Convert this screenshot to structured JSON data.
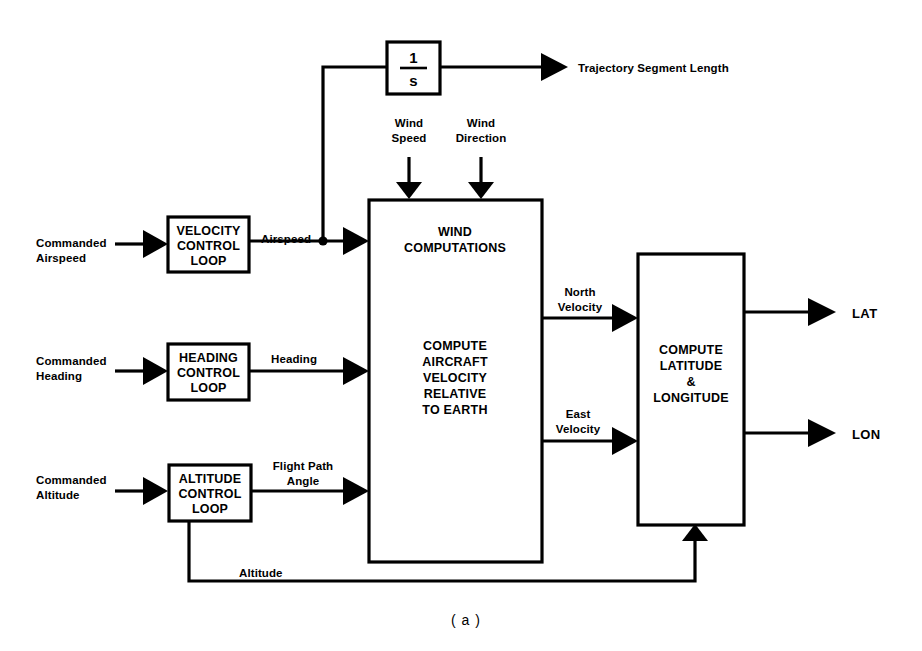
{
  "figure": {
    "caption": "( a )"
  },
  "blocks": {
    "integrator": {
      "numerator": "1",
      "denominator": "s"
    },
    "velocity_loop": {
      "line1": "VELOCITY",
      "line2": "CONTROL",
      "line3": "LOOP"
    },
    "heading_loop": {
      "line1": "HEADING",
      "line2": "CONTROL",
      "line3": "LOOP"
    },
    "altitude_loop": {
      "line1": "ALTITUDE",
      "line2": "CONTROL",
      "line3": "LOOP"
    },
    "wind_block": {
      "top1": "WIND",
      "top2": "COMPUTATIONS",
      "mid1": "COMPUTE",
      "mid2": "AIRCRAFT",
      "mid3": "VELOCITY",
      "mid4": "RELATIVE",
      "mid5": "TO EARTH"
    },
    "latlon_block": {
      "line1": "COMPUTE",
      "line2": "LATITUDE",
      "line3": "&",
      "line4": "LONGITUDE"
    }
  },
  "signals": {
    "trajectory_segment_length": "Trajectory Segment Length",
    "wind_speed_1": "Wind",
    "wind_speed_2": "Speed",
    "wind_direction_1": "Wind",
    "wind_direction_2": "Direction",
    "commanded_airspeed_1": "Commanded",
    "commanded_airspeed_2": "Airspeed",
    "airspeed": "Airspeed",
    "commanded_heading_1": "Commanded",
    "commanded_heading_2": "Heading",
    "heading": "Heading",
    "commanded_altitude_1": "Commanded",
    "commanded_altitude_2": "Altitude",
    "flight_path_angle_1": "Flight Path",
    "flight_path_angle_2": "Angle",
    "north_velocity_1": "North",
    "north_velocity_2": "Velocity",
    "east_velocity_1": "East",
    "east_velocity_2": "Velocity",
    "altitude_feedback": "Altitude",
    "lat_output": "LAT",
    "lon_output": "LON"
  },
  "colors": {
    "line": "#000000",
    "background": "#ffffff",
    "text": "#000000"
  }
}
